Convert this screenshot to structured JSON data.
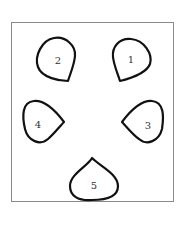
{
  "diagram": {
    "title": "",
    "petals": [
      {
        "label": "1"
      },
      {
        "label": "2"
      },
      {
        "label": "3"
      },
      {
        "label": "4"
      },
      {
        "label": "5"
      }
    ],
    "colors": {
      "stroke": "#111111",
      "frame": "#8a8a8a",
      "background": "#ffffff"
    }
  }
}
